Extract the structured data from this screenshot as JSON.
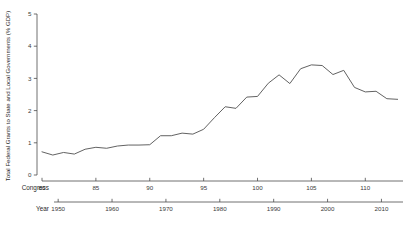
{
  "chart_data": {
    "type": "line",
    "title": "",
    "xlabel": "Congress",
    "ylabel": "Total Federal Grants to State and Local Governments (% GDP)",
    "ylim": [
      0,
      5
    ],
    "xlim": [
      80,
      113.5
    ],
    "grid": false,
    "legend": null,
    "y_ticks": [
      "0",
      "1",
      "2",
      "3",
      "4",
      "5"
    ],
    "y_tick_values": [
      0,
      1,
      2,
      3,
      4,
      5
    ],
    "secondary_axis": {
      "label": "Year",
      "ticks": [
        "1950",
        "1960",
        "1970",
        "1980",
        "1990",
        "2000",
        "2010"
      ],
      "tick_values": [
        1950,
        1960,
        1970,
        1980,
        1990,
        2000,
        2010
      ],
      "range": [
        1947,
        2014
      ]
    },
    "x_ticks": [
      "80",
      "85",
      "90",
      "95",
      "100",
      "105",
      "110"
    ],
    "x_tick_values": [
      80,
      85,
      90,
      95,
      100,
      105,
      110
    ],
    "x": [
      80,
      81,
      82,
      83,
      84,
      85,
      86,
      87,
      88,
      89,
      90,
      91,
      92,
      93,
      94,
      95,
      96,
      97,
      98,
      99,
      100,
      101,
      102,
      103,
      104,
      105,
      106,
      107,
      108,
      109,
      110,
      111,
      112,
      113
    ],
    "values": [
      0.72,
      0.62,
      0.7,
      0.65,
      0.8,
      0.86,
      0.83,
      0.9,
      0.93,
      0.93,
      0.94,
      1.22,
      1.22,
      1.3,
      1.27,
      1.42,
      1.78,
      2.12,
      2.07,
      2.42,
      2.44,
      2.85,
      3.11,
      2.84,
      3.3,
      3.42,
      3.4,
      3.12,
      3.25,
      2.72,
      2.58,
      2.6,
      2.37,
      2.35
    ],
    "series_name": "Federal grants to state and local governments",
    "line_color": "#5a5a5a"
  }
}
